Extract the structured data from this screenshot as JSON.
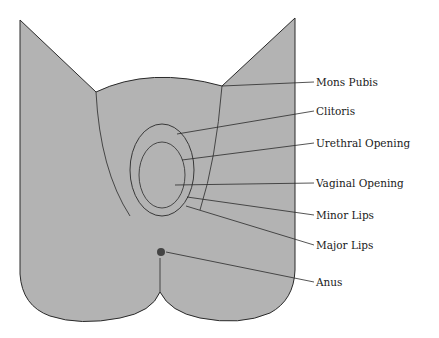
{
  "diagram": {
    "type": "anatomical-labeled-illustration",
    "colors": {
      "fill": "#b3b3b3",
      "line": "#2a2a2a",
      "background": "#ffffff"
    },
    "labels": [
      {
        "id": "mons-pubis",
        "text": "Mons Pubis",
        "x": 316,
        "y": 80,
        "target": [
          222,
          86
        ]
      },
      {
        "id": "clitoris",
        "text": "Clitoris",
        "x": 316,
        "y": 109,
        "target": [
          177,
          134
        ]
      },
      {
        "id": "urethral-opening",
        "text": "Urethral Opening",
        "x": 316,
        "y": 141,
        "target": [
          182,
          160
        ]
      },
      {
        "id": "vaginal-opening",
        "text": "Vaginal Opening",
        "x": 316,
        "y": 180,
        "target": [
          175,
          185
        ]
      },
      {
        "id": "minor-lips",
        "text": "Minor Lips",
        "x": 316,
        "y": 211,
        "target": [
          187,
          197
        ]
      },
      {
        "id": "major-lips",
        "text": "Major Lips",
        "x": 316,
        "y": 241,
        "target": [
          186,
          206
        ]
      },
      {
        "id": "anus",
        "text": "Anus",
        "x": 316,
        "y": 278,
        "target": [
          166,
          252
        ]
      }
    ]
  }
}
